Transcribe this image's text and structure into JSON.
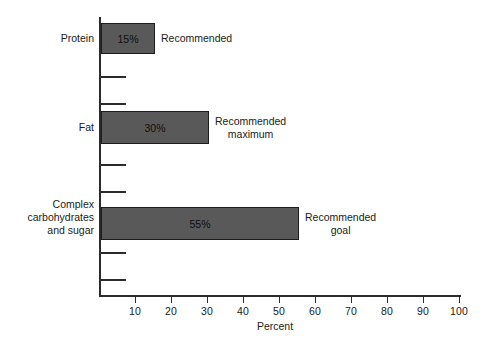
{
  "chart_data": {
    "type": "bar",
    "orientation": "horizontal",
    "title": "",
    "xlabel": "Percent",
    "ylabel": "",
    "xlim": [
      0,
      100
    ],
    "grid": false,
    "legend": "none",
    "categories": [
      "Protein",
      "Fat",
      "Complex\ncarbohydrates\nand sugar"
    ],
    "values": [
      15,
      30,
      55
    ],
    "data_labels": [
      "15%",
      "30%",
      "55%"
    ],
    "annotations": [
      "Recommended",
      "Recommended\nmaximum",
      "Recommended\ngoal"
    ],
    "xticks": [
      10,
      20,
      30,
      40,
      50,
      60,
      70,
      80,
      90,
      100
    ],
    "xtick_labels": [
      "10",
      "20",
      "30",
      "40",
      "50",
      "60",
      "70",
      "80",
      "90",
      "100"
    ],
    "bar_color": "#595959",
    "bar_edge_color": "#1c1c1c",
    "axis_color": "#2b2b2b",
    "background_color": "#ffffff",
    "points": [
      {
        "category": "Protein",
        "value": 15,
        "label": "15%",
        "annotation": "Recommended"
      },
      {
        "category": "Fat",
        "value": 30,
        "label": "30%",
        "annotation": "Recommended maximum"
      },
      {
        "category": "Complex carbohydrates and sugar",
        "value": 55,
        "label": "55%",
        "annotation": "Recommended goal"
      }
    ]
  }
}
